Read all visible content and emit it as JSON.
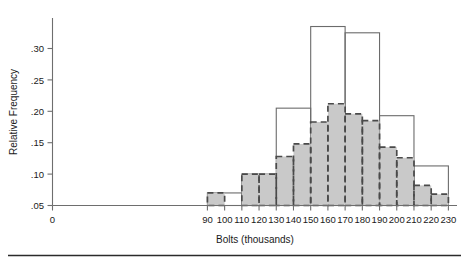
{
  "figure": {
    "background_color": "#ffffff",
    "fill_color": "#c9c9c9",
    "wide_stroke_color": "#6b6b6b",
    "narrow_stroke_color": "#4a4a4a"
  },
  "chart_data": {
    "type": "bar",
    "title": "",
    "xlabel": "Bolts (thousands)",
    "ylabel": "Relative Frequency",
    "xlim": [
      0,
      235
    ],
    "ylim": [
      0.05,
      0.345
    ],
    "grid": false,
    "legend": "none",
    "x_tick_labels": [
      "0",
      "90",
      "100",
      "110",
      "120",
      "130",
      "140",
      "150",
      "160",
      "170",
      "180",
      "190",
      "200",
      "210",
      "220",
      "230"
    ],
    "x_tick_values": [
      0,
      90,
      100,
      110,
      120,
      130,
      140,
      150,
      160,
      170,
      180,
      190,
      200,
      210,
      220,
      230
    ],
    "y_tick_labels": [
      ".05",
      ".10",
      ".15",
      ".20",
      ".25",
      ".30"
    ],
    "y_tick_values": [
      0.05,
      0.1,
      0.15,
      0.2,
      0.25,
      0.3
    ],
    "series": [
      {
        "name": "narrow-bins",
        "style": "dashed-outline-gray-fill",
        "bin_width": 10,
        "bins": [
          {
            "start": 90,
            "end": 100,
            "value": 0.07
          },
          {
            "start": 110,
            "end": 120,
            "value": 0.1
          },
          {
            "start": 120,
            "end": 130,
            "value": 0.1
          },
          {
            "start": 130,
            "end": 140,
            "value": 0.128
          },
          {
            "start": 140,
            "end": 150,
            "value": 0.148
          },
          {
            "start": 150,
            "end": 160,
            "value": 0.183
          },
          {
            "start": 160,
            "end": 170,
            "value": 0.212
          },
          {
            "start": 170,
            "end": 180,
            "value": 0.196
          },
          {
            "start": 180,
            "end": 190,
            "value": 0.185
          },
          {
            "start": 190,
            "end": 200,
            "value": 0.143
          },
          {
            "start": 200,
            "end": 210,
            "value": 0.126
          },
          {
            "start": 210,
            "end": 220,
            "value": 0.082
          },
          {
            "start": 220,
            "end": 230,
            "value": 0.068
          }
        ]
      },
      {
        "name": "wide-bins",
        "style": "solid-outline-no-fill",
        "bin_width": 20,
        "bins": [
          {
            "start": 90,
            "end": 110,
            "value": 0.07
          },
          {
            "start": 110,
            "end": 130,
            "value": 0.1
          },
          {
            "start": 130,
            "end": 150,
            "value": 0.205
          },
          {
            "start": 150,
            "end": 170,
            "value": 0.335
          },
          {
            "start": 170,
            "end": 190,
            "value": 0.325
          },
          {
            "start": 190,
            "end": 210,
            "value": 0.193
          },
          {
            "start": 210,
            "end": 230,
            "value": 0.113
          }
        ]
      }
    ]
  }
}
